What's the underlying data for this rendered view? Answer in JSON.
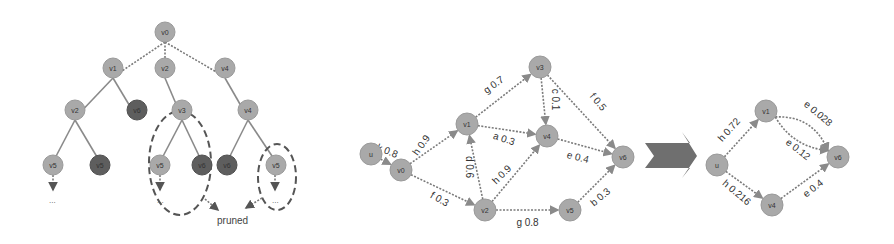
{
  "tree": {
    "nodes": [
      {
        "id": "root",
        "label": "v0",
        "shade": "light"
      },
      {
        "id": "a",
        "label": "v1",
        "shade": "light"
      },
      {
        "id": "b",
        "label": "v2",
        "shade": "light"
      },
      {
        "id": "c",
        "label": "v4",
        "shade": "light"
      },
      {
        "id": "a1",
        "label": "v2",
        "shade": "light"
      },
      {
        "id": "a2",
        "label": "v6",
        "shade": "dark"
      },
      {
        "id": "b1",
        "label": "v3",
        "shade": "light"
      },
      {
        "id": "c1",
        "label": "v4",
        "shade": "light"
      },
      {
        "id": "a1a",
        "label": "v5",
        "shade": "light"
      },
      {
        "id": "a1b",
        "label": "v5",
        "shade": "dark"
      },
      {
        "id": "b1a",
        "label": "v5",
        "shade": "light"
      },
      {
        "id": "b1b",
        "label": "v6",
        "shade": "dark"
      },
      {
        "id": "c1a",
        "label": "v6",
        "shade": "dark"
      },
      {
        "id": "c1b",
        "label": "v5",
        "shade": "light"
      }
    ],
    "ellipsis": "...",
    "pruned_label": "pruned"
  },
  "graph": {
    "nodes": [
      {
        "id": "u",
        "label": "u"
      },
      {
        "id": "v0",
        "label": "v0"
      },
      {
        "id": "v1",
        "label": "v1"
      },
      {
        "id": "v2",
        "label": "v2"
      },
      {
        "id": "v3",
        "label": "v3"
      },
      {
        "id": "v4",
        "label": "v4"
      },
      {
        "id": "v5",
        "label": "v5"
      },
      {
        "id": "v6",
        "label": "v6"
      }
    ],
    "edges": [
      {
        "from": "u",
        "to": "v0",
        "label": "k 0.8"
      },
      {
        "from": "v0",
        "to": "v1",
        "label": "h 0.9"
      },
      {
        "from": "v0",
        "to": "v2",
        "label": "f 0.3"
      },
      {
        "from": "v2",
        "to": "v1",
        "label": "d 0.6"
      },
      {
        "from": "v1",
        "to": "v3",
        "label": "g 0.7"
      },
      {
        "from": "v1",
        "to": "v4",
        "label": "a 0.3"
      },
      {
        "from": "v3",
        "to": "v4",
        "label": "c 0.1"
      },
      {
        "from": "v3",
        "to": "v6",
        "label": "f 0.5"
      },
      {
        "from": "v4",
        "to": "v6",
        "label": "e 0.4"
      },
      {
        "from": "v2",
        "to": "v4",
        "label": "h 0.9"
      },
      {
        "from": "v2",
        "to": "v5",
        "label": "g 0.8"
      },
      {
        "from": "v5",
        "to": "v6",
        "label": "b 0.3"
      }
    ]
  },
  "reduced": {
    "nodes": [
      {
        "id": "u",
        "label": "u"
      },
      {
        "id": "v1",
        "label": "v1"
      },
      {
        "id": "v4",
        "label": "v4"
      },
      {
        "id": "v6",
        "label": "v6"
      }
    ],
    "edges": [
      {
        "from": "u",
        "to": "v1",
        "label": "h 0.72"
      },
      {
        "from": "u",
        "to": "v4",
        "label": "h 0.216"
      },
      {
        "from": "v1",
        "to": "v6",
        "label": "e 0.028"
      },
      {
        "from": "v1",
        "to": "v6",
        "label": "e 0.12"
      },
      {
        "from": "v4",
        "to": "v6",
        "label": "e 0.4"
      }
    ]
  },
  "colors": {
    "node_light": "#a9a9a9",
    "node_dark": "#5e5e5e",
    "edge": "#8a8a8a",
    "arrow": "#6f6f6f"
  }
}
